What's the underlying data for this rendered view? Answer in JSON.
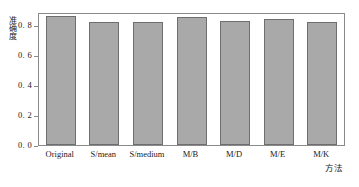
{
  "chart_data": {
    "type": "bar",
    "title": "",
    "xlabel": "方法",
    "ylabel": "准确度",
    "categories": [
      "Original",
      "S/mean",
      "S/medium",
      "M/B",
      "M/D",
      "M/E",
      "M/K"
    ],
    "values": [
      0.885,
      0.845,
      0.843,
      0.88,
      0.852,
      0.863,
      0.848
    ],
    "ylim": [
      0.0,
      0.9
    ],
    "yticks": [
      0.0,
      0.2,
      0.4,
      0.6,
      0.8
    ],
    "ytick_labels": [
      "0. 0",
      "0. 2",
      "0. 4",
      "0. 6",
      "0. 8"
    ],
    "grid": false,
    "legend": null,
    "bar_color": "#a9a9a9",
    "bar_edge_color": "#6e6e6e",
    "axis_color": "#8a8a8a"
  }
}
